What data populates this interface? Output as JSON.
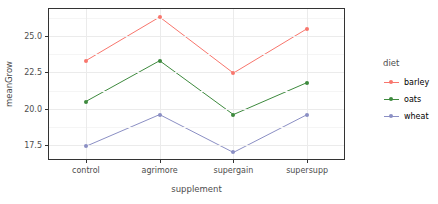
{
  "chart_data": {
    "type": "line",
    "title": "",
    "xlabel": "supplement",
    "ylabel": "meanGrow",
    "categories": [
      "control",
      "agrimore",
      "supergain",
      "supersupp"
    ],
    "series": [
      {
        "name": "barley",
        "color": "#F8766D",
        "values": [
          23.3,
          26.3,
          22.45,
          25.5
        ]
      },
      {
        "name": "oats",
        "color": "#3E8A3E",
        "values": [
          20.5,
          23.3,
          19.6,
          21.8
        ]
      },
      {
        "name": "wheat",
        "color": "#8B8FC4",
        "values": [
          17.42,
          19.6,
          17.0,
          19.6
        ]
      }
    ],
    "ylim": [
      16.55,
      26.85
    ],
    "y_major_ticks": [
      17.5,
      20.0,
      22.5,
      25.0
    ],
    "y_tick_labels": [
      "17.5",
      "20.0",
      "22.5",
      "25.0"
    ],
    "y_minor_ticks": [
      18.75,
      21.25,
      23.75,
      26.25
    ],
    "grid": true,
    "legend": {
      "title": "diet",
      "position": "right",
      "entries": [
        "barley",
        "oats",
        "wheat"
      ]
    }
  }
}
